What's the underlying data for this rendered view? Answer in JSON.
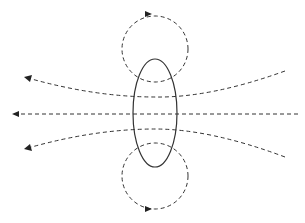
{
  "diagram": {
    "title": "",
    "colors": {
      "line": "#333333",
      "arrow": "#222222",
      "background": "#ffffff"
    },
    "loop": {
      "cx": 155,
      "cy": 113,
      "rx": 22,
      "ry": 54
    },
    "circulation_loops": [
      {
        "position": "top",
        "cx": 155,
        "cy": 49,
        "r": 33,
        "arrow_direction": "right"
      },
      {
        "position": "bottom",
        "cx": 155,
        "cy": 176,
        "r": 33,
        "arrow_direction": "right"
      }
    ],
    "field_lines": [
      {
        "position": "upper",
        "direction": "left"
      },
      {
        "position": "center",
        "direction": "left"
      },
      {
        "position": "lower",
        "direction": "left"
      }
    ]
  }
}
